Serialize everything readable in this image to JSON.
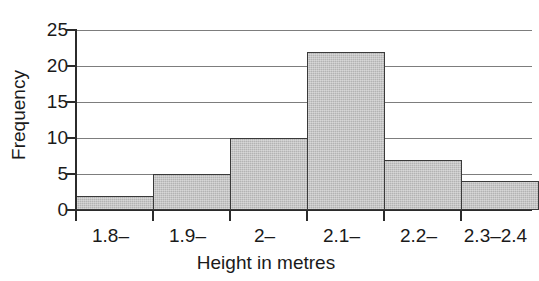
{
  "chart_data": {
    "type": "bar",
    "title": "",
    "subtitle": "",
    "xlabel": "Height in metres",
    "ylabel": "Frequency",
    "categories": [
      "1.8–",
      "1.9–",
      "2–",
      "2.1–",
      "2.2–",
      "2.3–2.4"
    ],
    "values": [
      2,
      5,
      10,
      22,
      7,
      4
    ],
    "ylim": [
      0,
      25
    ],
    "ytick_labels": [
      "0",
      "5",
      "10",
      "15",
      "20",
      "25"
    ],
    "ytick_values": [
      0,
      5,
      10,
      15,
      20,
      25
    ],
    "grid": true,
    "grid_axis": "y",
    "legend": false,
    "legend_position": "none",
    "bar_gap": 0
  },
  "style": {
    "bar_fill": "#b3b3b3",
    "bar_stroke": "#3a3a3a",
    "gridline_color": "#7d7d7d",
    "axis_color": "#2b2b2b",
    "text_color": "#1a1a1a",
    "background": "#ffffff"
  }
}
